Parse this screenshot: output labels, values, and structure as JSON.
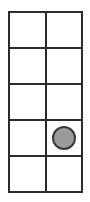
{
  "figure": {
    "kind": "grid-with-marker",
    "background_color": "#ffffff",
    "grid": {
      "columns": 2,
      "rows": 5,
      "line_color": "#2b2b2b",
      "line_width_px": 2,
      "cell_fill_color": "#ffffff",
      "left_px": 8,
      "top_px": 11,
      "width_px": 75,
      "height_px": 182
    },
    "marker": {
      "shape": "circle",
      "fill_color": "#9a9a9a",
      "outline_color": "#383838",
      "diameter_px": 24,
      "row": 4,
      "column": 2
    },
    "cells": [
      {
        "row": 1,
        "column": 1,
        "marker": false,
        "label": ""
      },
      {
        "row": 1,
        "column": 2,
        "marker": false,
        "label": ""
      },
      {
        "row": 2,
        "column": 1,
        "marker": false,
        "label": ""
      },
      {
        "row": 2,
        "column": 2,
        "marker": false,
        "label": ""
      },
      {
        "row": 3,
        "column": 1,
        "marker": false,
        "label": ""
      },
      {
        "row": 3,
        "column": 2,
        "marker": false,
        "label": ""
      },
      {
        "row": 4,
        "column": 1,
        "marker": false,
        "label": ""
      },
      {
        "row": 4,
        "column": 2,
        "marker": true,
        "label": ""
      },
      {
        "row": 5,
        "column": 1,
        "marker": false,
        "label": ""
      },
      {
        "row": 5,
        "column": 2,
        "marker": false,
        "label": ""
      }
    ]
  }
}
